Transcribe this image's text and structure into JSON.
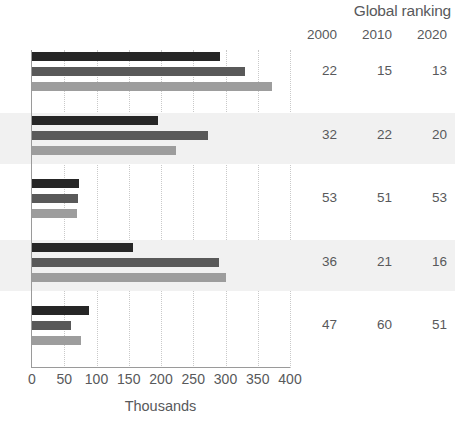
{
  "header": {
    "title": "Global ranking",
    "year_columns": [
      "2000",
      "2010",
      "2020"
    ]
  },
  "axis": {
    "x_title": "Thousands",
    "x_ticks": [
      "0",
      "50",
      "100",
      "150",
      "200",
      "250",
      "300",
      "350",
      "400"
    ]
  },
  "colors": {
    "series_2000": "#262626",
    "series_2010": "#595959",
    "series_2020": "#9d9d9d",
    "band": "#f1f1f1",
    "text": "#58595b",
    "axis": "#9a9a9a",
    "gridline": "#c9c9c9"
  },
  "rows": [
    {
      "index": 0,
      "banded": false,
      "values": [
        292,
        330,
        372
      ],
      "ranks": [
        "22",
        "15",
        "13"
      ]
    },
    {
      "index": 1,
      "banded": true,
      "values": [
        195,
        273,
        224
      ],
      "ranks": [
        "32",
        "22",
        "20"
      ]
    },
    {
      "index": 2,
      "banded": false,
      "values": [
        73,
        71,
        69
      ],
      "ranks": [
        "53",
        "51",
        "53"
      ]
    },
    {
      "index": 3,
      "banded": true,
      "values": [
        156,
        290,
        300
      ],
      "ranks": [
        "36",
        "21",
        "16"
      ]
    },
    {
      "index": 4,
      "banded": false,
      "values": [
        88,
        60,
        76
      ],
      "ranks": [
        "47",
        "60",
        "51"
      ]
    }
  ],
  "chart_data": {
    "type": "bar",
    "orientation": "horizontal",
    "title": "",
    "subtitle": "",
    "xlabel": "Thousands",
    "ylabel": "",
    "xlim": [
      0,
      400
    ],
    "xticks": [
      0,
      50,
      100,
      150,
      200,
      250,
      300,
      350,
      400
    ],
    "grid": true,
    "legend": false,
    "categories": [
      "Group 1",
      "Group 2",
      "Group 3",
      "Group 4",
      "Group 5"
    ],
    "series": [
      {
        "name": "2000",
        "color": "#262626",
        "values": [
          292,
          195,
          73,
          156,
          88
        ]
      },
      {
        "name": "2010",
        "color": "#595959",
        "values": [
          330,
          273,
          71,
          290,
          60
        ]
      },
      {
        "name": "2020",
        "color": "#9d9d9d",
        "values": [
          372,
          224,
          69,
          300,
          76
        ]
      }
    ],
    "side_table": {
      "title": "Global ranking",
      "columns": [
        "2000",
        "2010",
        "2020"
      ],
      "rows": [
        [
          "22",
          "15",
          "13"
        ],
        [
          "32",
          "22",
          "20"
        ],
        [
          "53",
          "51",
          "53"
        ],
        [
          "36",
          "21",
          "16"
        ],
        [
          "47",
          "60",
          "51"
        ]
      ]
    },
    "annotations": []
  }
}
